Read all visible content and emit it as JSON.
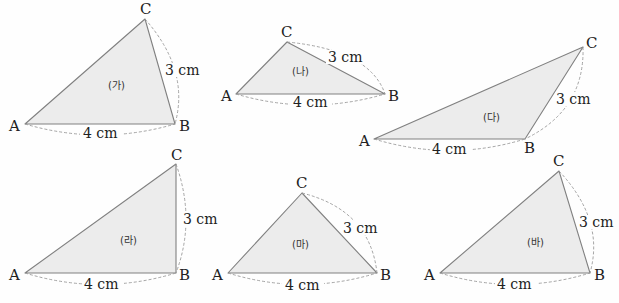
{
  "diagram": {
    "triangles": [
      {
        "name": "(가)",
        "A": [
          25,
          124
        ],
        "B": [
          175,
          124
        ],
        "C": [
          145,
          19
        ],
        "ab_label": "4 cm",
        "bc_label": "3 cm"
      },
      {
        "name": "(나)",
        "A": [
          236,
          94
        ],
        "B": [
          385,
          94
        ],
        "C": [
          287,
          42
        ],
        "ab_label": "4 cm",
        "bc_label": "3 cm"
      },
      {
        "name": "(다)",
        "A": [
          374,
          139
        ],
        "B": [
          525,
          139
        ],
        "C": [
          583,
          47
        ],
        "ab_label": "4 cm",
        "bc_label": "3 cm"
      },
      {
        "name": "(라)",
        "A": [
          25,
          273
        ],
        "B": [
          176,
          273
        ],
        "C": [
          176,
          164
        ],
        "ab_label": "4 cm",
        "bc_label": "3 cm"
      },
      {
        "name": "(마)",
        "A": [
          228,
          273
        ],
        "B": [
          377,
          273
        ],
        "C": [
          302,
          193
        ],
        "ab_label": "4 cm",
        "bc_label": "3 cm"
      },
      {
        "name": "(바)",
        "A": [
          440,
          273
        ],
        "B": [
          590,
          273
        ],
        "C": [
          559,
          171
        ],
        "ab_label": "4 cm",
        "bc_label": "3 cm"
      }
    ],
    "vertex_labels": {
      "a": "A",
      "b": "B",
      "c": "C"
    },
    "colors": {
      "fill": "#ececec",
      "stroke": "#808080",
      "dashed": "#9a9a9a",
      "text": "#222222"
    }
  }
}
